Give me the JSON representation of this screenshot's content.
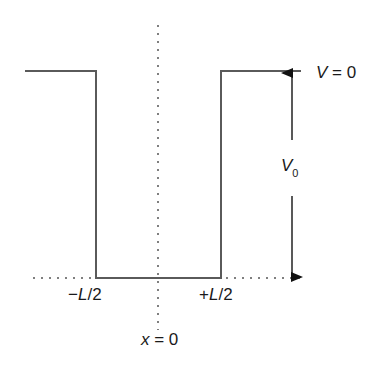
{
  "diagram": {
    "colors": {
      "line": "#555555",
      "dotted": "#555555",
      "text": "#1a1a1a",
      "background": "#ffffff"
    },
    "labels": {
      "top_level": {
        "var": "V",
        "rest": " = 0"
      },
      "depth": {
        "var": "V",
        "sub": "0"
      },
      "left_edge": {
        "sign": "−",
        "var": "L",
        "rest": "/2"
      },
      "right_edge": {
        "sign": "+",
        "var": "L",
        "rest": "/2"
      },
      "center": {
        "var": "x",
        "rest": " = 0"
      }
    },
    "geometry": {
      "top_y": 71,
      "bottom_y": 278,
      "left_wall_x": 96,
      "right_wall_x": 221,
      "center_x": 158,
      "arrow_x": 292
    }
  }
}
